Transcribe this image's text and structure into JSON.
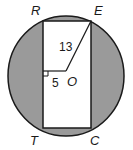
{
  "figure": {
    "type": "geometry",
    "colors": {
      "shade": "#9a9a9a",
      "stroke": "#1a1a1a",
      "background": "#ffffff"
    },
    "points": {
      "R": "R",
      "E": "E",
      "T": "T",
      "C": "C",
      "O": "O"
    },
    "measurements": {
      "OE": "13",
      "distance_to_side": "5"
    }
  }
}
